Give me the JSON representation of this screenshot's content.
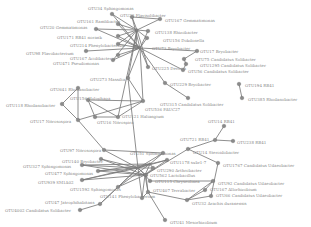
{
  "diagram": {
    "type": "co-occurrence-network",
    "background": "#ffffff",
    "colors": {
      "edge": "#7a7a7a",
      "node": "#8a8a8a",
      "label": "#8a8a8a"
    },
    "nodes": [
      {
        "id": "n1",
        "label": "OTU34 Sphingomonas",
        "x": 112,
        "y": 14,
        "lx": 88,
        "ly": 8
      },
      {
        "id": "n2",
        "label": "OTU23 Flavisolibacter",
        "x": 132,
        "y": 17,
        "lx": 120,
        "ly": 15
      },
      {
        "id": "n3",
        "label": "OTU167 Gemmatimonas",
        "x": 160,
        "y": 19,
        "lx": 165,
        "ly": 20
      },
      {
        "id": "n4",
        "label": "OTU20 Gemmatimonas",
        "x": 96,
        "y": 29,
        "lx": 40,
        "ly": 27
      },
      {
        "id": "n5",
        "label": "OTU161 Ramlibacter",
        "x": 118,
        "y": 24,
        "lx": 77,
        "ly": 21
      },
      {
        "id": "n6",
        "label": "OTU171 RB41 norank",
        "x": 118,
        "y": 36,
        "lx": 57,
        "ly": 37
      },
      {
        "id": "n7",
        "label": "OTU138 Rhizobacter",
        "x": 148,
        "y": 31,
        "lx": 155,
        "ly": 32
      },
      {
        "id": "n8",
        "label": "OTU156 Dokdonella",
        "x": 147,
        "y": 38,
        "lx": 163,
        "ly": 40
      },
      {
        "id": "n9",
        "label": "OTU214 Phenylobacterium",
        "x": 118,
        "y": 44,
        "lx": 70,
        "ly": 45
      },
      {
        "id": "n10",
        "label": "OTU98 Flavobacterium",
        "x": 86,
        "y": 51,
        "lx": 26,
        "ly": 53
      },
      {
        "id": "n11",
        "label": "OTU167 Acidibacter",
        "x": 118,
        "y": 55,
        "lx": 70,
        "ly": 58
      },
      {
        "id": "n12",
        "label": "OTU471 Pseudomonas",
        "x": 113,
        "y": 60,
        "lx": 53,
        "ly": 63
      },
      {
        "id": "n13",
        "label": "OTU73 Bryobacter",
        "x": 136,
        "y": 47,
        "lx": 152,
        "ly": 48
      },
      {
        "id": "n14",
        "label": "OTU17 Bryobacter",
        "x": 197,
        "y": 51,
        "lx": 200,
        "ly": 51
      },
      {
        "id": "n15",
        "label": "OTU75 Candidatus Solibacter",
        "x": 184,
        "y": 59,
        "lx": 195,
        "ly": 59
      },
      {
        "id": "n16",
        "label": "OTU1295 Candidatus Solibacter",
        "x": 186,
        "y": 64,
        "lx": 200,
        "ly": 65
      },
      {
        "id": "n17",
        "label": "OTU56 Candidatus Solibacter",
        "x": 183,
        "y": 70,
        "lx": 188,
        "ly": 71
      },
      {
        "id": "n18",
        "label": "OTU225 Devosia",
        "x": 148,
        "y": 67,
        "lx": 152,
        "ly": 68
      },
      {
        "id": "n19",
        "label": "OTU273 Massilia",
        "x": 128,
        "y": 78,
        "lx": 90,
        "ly": 79
      },
      {
        "id": "n20",
        "label": "OTU229 Bryobacter",
        "x": 165,
        "y": 83,
        "lx": 170,
        "ly": 84
      },
      {
        "id": "n21",
        "label": "OTU194 RB41",
        "x": 239,
        "y": 84,
        "lx": 245,
        "ly": 85
      },
      {
        "id": "n22",
        "label": "OTU385 Rhodanobacter",
        "x": 242,
        "y": 98,
        "lx": 248,
        "ly": 99
      },
      {
        "id": "n23",
        "label": "OTU641 Rhodanobacter",
        "x": 78,
        "y": 88,
        "lx": 50,
        "ly": 89
      },
      {
        "id": "n24",
        "label": "OTU118 Rhodanobacter",
        "x": 62,
        "y": 104,
        "lx": 6,
        "ly": 105
      },
      {
        "id": "n25",
        "label": "OTU156 Holophaga",
        "x": 88,
        "y": 100,
        "lx": 70,
        "ly": 98
      },
      {
        "id": "n26",
        "label": "OTU315 Candidatus Solibacter",
        "x": 188,
        "y": 98,
        "lx": 160,
        "ly": 104
      },
      {
        "id": "n27",
        "label": "OTU536 FAUC27",
        "x": 143,
        "y": 101,
        "lx": 145,
        "ly": 109
      },
      {
        "id": "n28",
        "label": "OTU121 Haliangium",
        "x": 118,
        "y": 117,
        "lx": 122,
        "ly": 116
      },
      {
        "id": "n29",
        "label": "OTU16 Nitrospira",
        "x": 95,
        "y": 117,
        "lx": 97,
        "ly": 122
      },
      {
        "id": "n30",
        "label": "OTU17 Nitrosospira",
        "x": 78,
        "y": 120,
        "lx": 30,
        "ly": 121
      },
      {
        "id": "n31",
        "label": "OTU14 RB41",
        "x": 224,
        "y": 126,
        "lx": 208,
        "ly": 121
      },
      {
        "id": "n32",
        "label": "OTU721 RB41",
        "x": 215,
        "y": 140,
        "lx": 180,
        "ly": 139
      },
      {
        "id": "n33",
        "label": "OTU238 RB41",
        "x": 233,
        "y": 141,
        "lx": 237,
        "ly": 142
      },
      {
        "id": "n34",
        "label": "OTU14 Steroidobacter",
        "x": 188,
        "y": 149,
        "lx": 193,
        "ly": 152
      },
      {
        "id": "n35",
        "label": "OTU51 Sphingomonas",
        "x": 163,
        "y": 153,
        "lx": 130,
        "ly": 153
      },
      {
        "id": "n36",
        "label": "OTU97 Nitrosospira",
        "x": 104,
        "y": 150,
        "lx": 60,
        "ly": 150
      },
      {
        "id": "n37",
        "label": "OTU140 Bryobacter",
        "x": 101,
        "y": 159,
        "lx": 62,
        "ly": 161
      },
      {
        "id": "n38",
        "label": "OTU327 Sphingomonas",
        "x": 82,
        "y": 165,
        "lx": 23,
        "ly": 166
      },
      {
        "id": "n39",
        "label": "OTU477 Sphingomonas",
        "x": 98,
        "y": 171,
        "lx": 45,
        "ly": 173
      },
      {
        "id": "n40",
        "label": "OTU1178 subr1-7",
        "x": 167,
        "y": 160,
        "lx": 170,
        "ly": 162
      },
      {
        "id": "n41",
        "label": "OTU1767 Candidatus Udaeobacter",
        "x": 218,
        "y": 163,
        "lx": 223,
        "ly": 165
      },
      {
        "id": "n42",
        "label": "OTU290 Arthrobacter",
        "x": 153,
        "y": 168,
        "lx": 157,
        "ly": 170
      },
      {
        "id": "n43",
        "label": "OTU562 Lactobacillus",
        "x": 146,
        "y": 175,
        "lx": 150,
        "ly": 175
      },
      {
        "id": "n44",
        "label": "OTU939 SM1A02",
        "x": 82,
        "y": 180,
        "lx": 38,
        "ly": 182
      },
      {
        "id": "n45",
        "label": "OTU115 Chryseolinea",
        "x": 150,
        "y": 181,
        "lx": 155,
        "ly": 181
      },
      {
        "id": "n46",
        "label": "OTU1592 Sphingomonas",
        "x": 118,
        "y": 187,
        "lx": 70,
        "ly": 189
      },
      {
        "id": "n47",
        "label": "OTU92 Candidatus Udaeobacter",
        "x": 213,
        "y": 181,
        "lx": 218,
        "ly": 183
      },
      {
        "id": "n48",
        "label": "OTU407 Terrabacter",
        "x": 148,
        "y": 192,
        "lx": 153,
        "ly": 190
      },
      {
        "id": "n49",
        "label": "OTU167 Allorhizobium",
        "x": 205,
        "y": 190,
        "lx": 210,
        "ly": 189
      },
      {
        "id": "n50",
        "label": "OTU141 Phenylobacterium",
        "x": 142,
        "y": 198,
        "lx": 100,
        "ly": 196
      },
      {
        "id": "n51",
        "label": "OTU66 Candidatus Udaeobacter",
        "x": 211,
        "y": 196,
        "lx": 216,
        "ly": 195
      },
      {
        "id": "n52",
        "label": "OTU47 Jatrophihabitans",
        "x": 100,
        "y": 204,
        "lx": 45,
        "ly": 202
      },
      {
        "id": "n53",
        "label": "OTU32 Arachis duranensis",
        "x": 187,
        "y": 200,
        "lx": 192,
        "ly": 203
      },
      {
        "id": "n54",
        "label": "OTU4002 Candidatus Solibacter",
        "x": 80,
        "y": 210,
        "lx": 5,
        "ly": 210
      },
      {
        "id": "n55",
        "label": "OTU41 Mesorhizobium",
        "x": 165,
        "y": 220,
        "lx": 170,
        "ly": 222
      },
      {
        "id": "h1",
        "label": "",
        "x": 137,
        "y": 30,
        "lx": 0,
        "ly": 0
      },
      {
        "id": "h2",
        "label": "",
        "x": 140,
        "y": 48,
        "lx": 0,
        "ly": 0
      },
      {
        "id": "h3",
        "label": "",
        "x": 145,
        "y": 175,
        "lx": 0,
        "ly": 0
      },
      {
        "id": "h4",
        "label": "",
        "x": 138,
        "y": 168,
        "lx": 0,
        "ly": 0
      },
      {
        "id": "h5",
        "label": "",
        "x": 150,
        "y": 164,
        "lx": 0,
        "ly": 0
      }
    ],
    "edges": [
      [
        "n1",
        "h1"
      ],
      [
        "n2",
        "h1"
      ],
      [
        "n3",
        "n2"
      ],
      [
        "n3",
        "h1"
      ],
      [
        "n4",
        "h1"
      ],
      [
        "n5",
        "h1"
      ],
      [
        "n6",
        "h1"
      ],
      [
        "n7",
        "h1"
      ],
      [
        "n8",
        "h1"
      ],
      [
        "n9",
        "h1"
      ],
      [
        "n10",
        "h2"
      ],
      [
        "n11",
        "h2"
      ],
      [
        "n12",
        "h2"
      ],
      [
        "n13",
        "h1"
      ],
      [
        "n13",
        "h2"
      ],
      [
        "n14",
        "n15"
      ],
      [
        "n14",
        "h2"
      ],
      [
        "n15",
        "n16"
      ],
      [
        "n16",
        "n17"
      ],
      [
        "n17",
        "h2"
      ],
      [
        "n18",
        "h1"
      ],
      [
        "n18",
        "h2"
      ],
      [
        "n19",
        "h1"
      ],
      [
        "n19",
        "h2"
      ],
      [
        "n20",
        "h2"
      ],
      [
        "n20",
        "n26"
      ],
      [
        "n21",
        "n22"
      ],
      [
        "n5",
        "h2"
      ],
      [
        "n6",
        "h2"
      ],
      [
        "n9",
        "h2"
      ],
      [
        "n2",
        "h2"
      ],
      [
        "n4",
        "h2"
      ],
      [
        "n7",
        "h2"
      ],
      [
        "n8",
        "h2"
      ],
      [
        "n1",
        "h2"
      ],
      [
        "n12",
        "h1"
      ],
      [
        "n23",
        "n30"
      ],
      [
        "n24",
        "n23"
      ],
      [
        "n24",
        "n30"
      ],
      [
        "n25",
        "n29"
      ],
      [
        "n25",
        "n27"
      ],
      [
        "n29",
        "n28"
      ],
      [
        "n28",
        "n27"
      ],
      [
        "n25",
        "n28"
      ],
      [
        "n30",
        "n27"
      ],
      [
        "n27",
        "h2"
      ],
      [
        "n27",
        "n19"
      ],
      [
        "n30",
        "n36"
      ],
      [
        "n36",
        "h4"
      ],
      [
        "n36",
        "n35"
      ],
      [
        "n28",
        "h1"
      ],
      [
        "n31",
        "n32"
      ],
      [
        "n32",
        "n33"
      ],
      [
        "n32",
        "n34"
      ],
      [
        "n34",
        "n41"
      ],
      [
        "n34",
        "h3"
      ],
      [
        "n35",
        "h5"
      ],
      [
        "n19",
        "h4"
      ],
      [
        "n37",
        "h4"
      ],
      [
        "n38",
        "h4"
      ],
      [
        "n38",
        "h3"
      ],
      [
        "n39",
        "h4"
      ],
      [
        "n39",
        "h3"
      ],
      [
        "n40",
        "h4"
      ],
      [
        "n40",
        "h3"
      ],
      [
        "n42",
        "h4"
      ],
      [
        "n42",
        "h3"
      ],
      [
        "n43",
        "h4"
      ],
      [
        "n44",
        "h4"
      ],
      [
        "n44",
        "h3"
      ],
      [
        "n45",
        "h3"
      ],
      [
        "n46",
        "h4"
      ],
      [
        "n46",
        "h3"
      ],
      [
        "n47",
        "n49"
      ],
      [
        "n47",
        "n53"
      ],
      [
        "n41",
        "n51"
      ],
      [
        "n49",
        "n53"
      ],
      [
        "n51",
        "n53"
      ],
      [
        "n48",
        "h3"
      ],
      [
        "n48",
        "n53"
      ],
      [
        "n50",
        "h3"
      ],
      [
        "n50",
        "h4"
      ],
      [
        "n52",
        "n46"
      ],
      [
        "n52",
        "h4"
      ],
      [
        "n54",
        "n52"
      ],
      [
        "n55",
        "n48"
      ],
      [
        "n45",
        "n47"
      ],
      [
        "n43",
        "n48"
      ],
      [
        "h3",
        "h4"
      ],
      [
        "h4",
        "h5"
      ],
      [
        "h5",
        "h3"
      ],
      [
        "n37",
        "h3"
      ],
      [
        "n35",
        "h4"
      ],
      [
        "n40",
        "h5"
      ],
      [
        "n42",
        "h5"
      ],
      [
        "n38",
        "h5"
      ],
      [
        "n39",
        "h5"
      ],
      [
        "n46",
        "h5"
      ],
      [
        "n44",
        "h5"
      ],
      [
        "n50",
        "n48"
      ]
    ]
  }
}
